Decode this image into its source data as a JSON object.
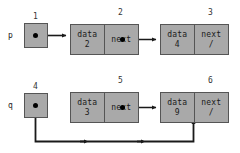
{
  "diagram": {
    "type": "linked-list",
    "background_color": "#ffffff",
    "node_fill_color": "#a9a9a9",
    "node_border_color": "#555555",
    "wire_color": "#1a1a1a",
    "null_symbol": "/",
    "field_labels": {
      "data": "data",
      "next": "next"
    },
    "pointers": [
      {
        "name": "p",
        "index_label": "1",
        "target_index_label": "2"
      },
      {
        "name": "q",
        "index_label": "4",
        "target_index_label": "6"
      }
    ],
    "nodes": [
      {
        "index_label": "2",
        "data_label": "data",
        "next_label": "next",
        "data_value": "2",
        "next_value": "",
        "next_is_null": false,
        "points_to_index_label": "3"
      },
      {
        "index_label": "3",
        "data_label": "data",
        "next_label": "next",
        "data_value": "4",
        "next_value": "/",
        "next_is_null": true,
        "points_to_index_label": ""
      },
      {
        "index_label": "5",
        "data_label": "data",
        "next_label": "next",
        "data_value": "3",
        "next_value": "",
        "next_is_null": false,
        "points_to_index_label": "6"
      },
      {
        "index_label": "6",
        "data_label": "data",
        "next_label": "next",
        "data_value": "9",
        "next_value": "/",
        "next_is_null": true,
        "points_to_index_label": ""
      }
    ]
  }
}
